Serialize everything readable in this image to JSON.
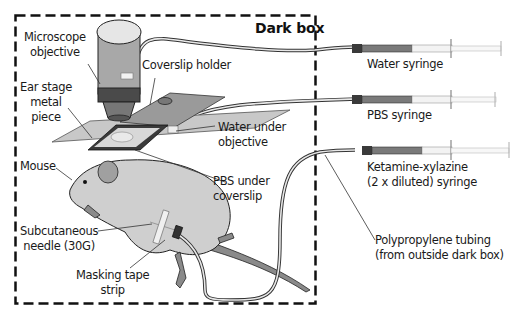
{
  "figure": {
    "box_title": "Dark box",
    "labels": {
      "microscope_objective": [
        "Microscope",
        "objective"
      ],
      "coverslip_holder": "Coverslip holder",
      "ear_stage": [
        "Ear stage",
        "metal",
        "piece"
      ],
      "water_under_objective": [
        "Water under",
        "objective"
      ],
      "mouse": "Mouse",
      "pbs_under_coverslip": [
        "PBS under",
        "coverslip"
      ],
      "subcutaneous_needle": [
        "Subcutaneous",
        "needle (30G)"
      ],
      "masking_tape": [
        "Masking tape",
        "strip"
      ],
      "water_syringe": "Water syringe",
      "pbs_syringe": "PBS syringe",
      "ketamine_syringe": [
        "Ketamine-xylazine",
        "(2 x diluted) syringe"
      ],
      "tubing": [
        "Polypropylene tubing",
        "(from outside dark box)"
      ]
    },
    "colors": {
      "mouse_body": "#cfcfcf",
      "mouse_ear": "#a0a0a0",
      "mouse_tail": "#8a8a8a",
      "objective_body": "#a8a8a8",
      "objective_band": "#4a4a4a",
      "stage": "#c4c4c4",
      "syringe_dark": "#3a3a3a",
      "outline": "#1a1a1a"
    }
  }
}
